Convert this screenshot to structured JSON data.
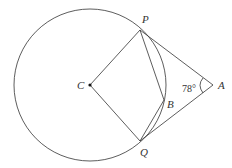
{
  "diagram": {
    "type": "geometry",
    "labels": {
      "P": "P",
      "Q": "Q",
      "C": "C",
      "B": "B",
      "A": "A",
      "angle_A": "78°"
    },
    "colors": {
      "stroke": "#333333",
      "background": "#ffffff"
    }
  }
}
